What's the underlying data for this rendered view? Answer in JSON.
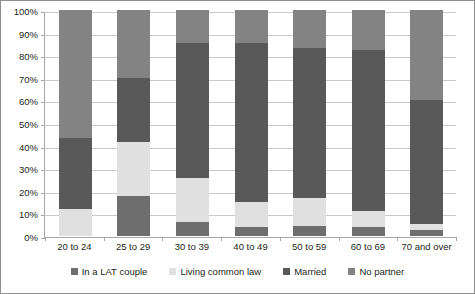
{
  "chart": {
    "title": "",
    "ylabel": "",
    "xlabel": ""
  },
  "colors": {
    "lat_couple": "#6e6e6e",
    "living_common_law": "#e0e0e0",
    "married": "#595959",
    "no_partner": "#838383",
    "gridline": "#c9c9c9",
    "axis": "#a6a6a6",
    "text": "#231f20",
    "background": "#ffffff"
  },
  "y_axis": {
    "ticks": [
      "100%",
      "90%",
      "80%",
      "70%",
      "60%",
      "50%",
      "40%",
      "30%",
      "20%",
      "10%",
      "0%"
    ],
    "min": 0,
    "max": 100
  },
  "legend": {
    "items": [
      {
        "label": "In a LAT couple",
        "key": "lat_couple"
      },
      {
        "label": "Living common law",
        "key": "living_common_law"
      },
      {
        "label": "Married",
        "key": "married"
      },
      {
        "label": "No partner",
        "key": "no_partner"
      }
    ]
  },
  "chart_data": {
    "type": "bar",
    "subtype": "stacked-percentage",
    "title": "",
    "xlabel": "",
    "ylabel": "",
    "ylim": [
      0,
      100
    ],
    "grid": true,
    "legend_position": "bottom",
    "categories": [
      "20 to 24",
      "25 to 29",
      "30 to 39",
      "40 to 49",
      "50 to 59",
      "60 to 69",
      "70 and over"
    ],
    "series": [
      {
        "name": "In a LAT couple",
        "values": [
          0.0,
          17.5,
          6.0,
          4.0,
          4.5,
          4.0,
          2.5
        ]
      },
      {
        "name": "Living common law",
        "values": [
          12.0,
          24.0,
          19.5,
          11.0,
          12.5,
          7.0,
          3.0
        ]
      },
      {
        "name": "Married",
        "values": [
          31.5,
          28.5,
          60.0,
          70.5,
          66.0,
          71.5,
          54.5
        ]
      },
      {
        "name": "No partner",
        "values": [
          56.5,
          30.0,
          14.5,
          14.5,
          17.0,
          17.5,
          40.0
        ]
      }
    ],
    "cumulative_tops": {
      "In a LAT couple": [
        0.0,
        17.5,
        6.0,
        4.0,
        4.5,
        4.0,
        2.5
      ],
      "Living common law": [
        12.0,
        41.5,
        25.5,
        15.0,
        17.0,
        11.0,
        5.5
      ],
      "Married": [
        43.5,
        70.0,
        85.5,
        85.5,
        83.0,
        82.5,
        60.0
      ],
      "No partner": [
        100,
        100,
        100,
        100,
        100,
        100,
        100
      ]
    }
  }
}
